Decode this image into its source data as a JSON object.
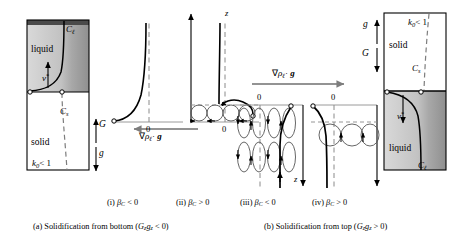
{
  "figure": {
    "type": "scientific-diagram",
    "panels_a": {
      "caption": "(a) Solidification from bottom (Gₓgₓ < 0)",
      "caption_parts": {
        "prefix": "(a) Solidification from bottom (",
        "symbol": "G",
        "sub1": "z",
        "symbol2": "g",
        "sub2": "z",
        "suffix": " < 0)"
      },
      "box": {
        "upper_region": "liquid",
        "lower_region": "solid",
        "labels": {
          "c_liquid": "C",
          "c_liquid_sub": "ℓ",
          "c_solid": "C",
          "c_solid_sub": "s",
          "partition": "k",
          "partition_sub": "0",
          "partition_rel": "< 1",
          "velocity": "v",
          "velocity_sup": "*",
          "gradient": "G",
          "gravity": "g"
        }
      },
      "subpanels": [
        {
          "id": "i",
          "label": "(i)",
          "beta": "β",
          "beta_sub": "C",
          "rel": "< 0",
          "zero": "0",
          "axis": "z",
          "convection": false
        },
        {
          "id": "ii",
          "label": "(ii)",
          "beta": "β",
          "beta_sub": "C",
          "rel": "> 0",
          "zero": "0",
          "axis": "z",
          "convection": true
        }
      ],
      "gradient_arrow": {
        "direction": "left",
        "label_nabla": "∇",
        "label_rho": "ρ",
        "label_rho_sub": "ℓ",
        "label_dot": "·",
        "label_g": "g"
      }
    },
    "panels_b": {
      "caption": "(b) Solidification from top (Gₓgₓ > 0)",
      "caption_parts": {
        "prefix": "(b) Solidification from top (",
        "symbol": "G",
        "sub1": "z",
        "symbol2": "g",
        "sub2": "z",
        "suffix": " > 0)"
      },
      "box": {
        "upper_region": "solid",
        "lower_region": "liquid",
        "labels": {
          "c_liquid": "C",
          "c_liquid_sub": "ℓ",
          "c_solid": "C",
          "c_solid_sub": "s",
          "partition": "k",
          "partition_sub": "0",
          "partition_rel": "< 1",
          "velocity": "v",
          "velocity_sup": "*",
          "gradient": "G",
          "gravity": "g"
        }
      },
      "subpanels": [
        {
          "id": "iii",
          "label": "(iii)",
          "beta": "β",
          "beta_sub": "C",
          "rel": "< 0",
          "zero": "0",
          "axis": "z",
          "convection": true
        },
        {
          "id": "iv",
          "label": "(iv)",
          "beta": "β",
          "beta_sub": "C",
          "rel": "> 0",
          "zero": "0",
          "axis": "z",
          "convection": true
        }
      ],
      "gradient_arrow": {
        "direction": "right",
        "label_nabla": "∇",
        "label_rho": "ρ",
        "label_rho_sub": "ℓ",
        "label_dot": "·",
        "label_g": "g"
      }
    },
    "colors": {
      "line": "#000000",
      "axis": "#8a8a8a",
      "dashed": "#8a8a8a",
      "liquid_light": "#d8d8d8",
      "liquid_dark": "#9a9a9a",
      "solid_fill": "#ffffff",
      "top_band": "#555555"
    }
  }
}
